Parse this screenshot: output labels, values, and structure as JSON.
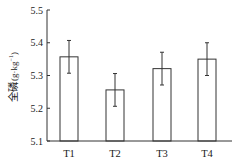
{
  "chart_data": {
    "type": "bar",
    "title": "",
    "xlabel": "",
    "ylabel": "全磷 (g·kg⁻¹)",
    "ylabel_main": "全磷",
    "ylabel_unit": "(g·kg",
    "ylabel_sup": "−1",
    "ylabel_close": ")",
    "categories": [
      "T1",
      "T2",
      "T3",
      "T4"
    ],
    "values": [
      5.357,
      5.256,
      5.321,
      5.35
    ],
    "errors": [
      0.05,
      0.05,
      0.05,
      0.05
    ],
    "ylim": [
      5.1,
      5.5
    ],
    "yticks": [
      "5.1",
      "5.2",
      "5.3",
      "5.4",
      "5.5"
    ],
    "grid": false,
    "legend": null,
    "bar_fill": "#ffffff",
    "bar_stroke": "#333333"
  }
}
